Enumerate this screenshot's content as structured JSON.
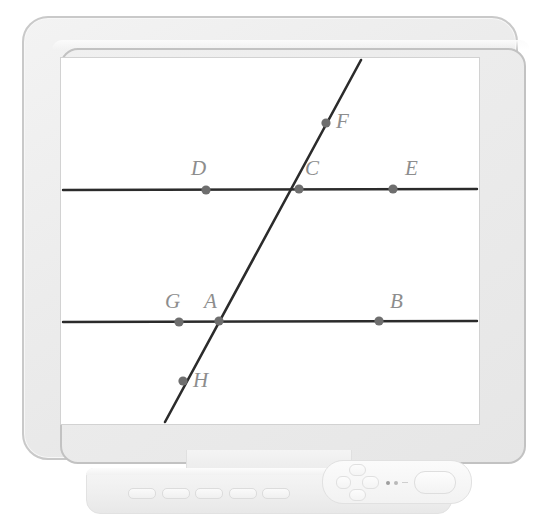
{
  "device": {
    "type": "lcd-monitor",
    "bezel_color": "#ececec",
    "screen_color": "#ffffff"
  },
  "controls": {
    "menu_buttons": [
      {
        "name": "menu-button-1",
        "label": ""
      },
      {
        "name": "menu-button-2",
        "label": ""
      },
      {
        "name": "menu-button-3",
        "label": ""
      },
      {
        "name": "menu-button-4",
        "label": ""
      },
      {
        "name": "menu-button-5",
        "label": ""
      }
    ],
    "dpad": {
      "up": "",
      "down": "",
      "left": "",
      "right": ""
    },
    "indicators": [
      {
        "name": "led-indicator-1",
        "color": "#9e9e9e"
      },
      {
        "name": "led-indicator-2",
        "color": "#b9b9b9"
      }
    ],
    "power_button_label": ""
  },
  "chart_data": {
    "type": "diagram",
    "title": "",
    "subtitle": "",
    "xlabel": "",
    "ylabel": "",
    "line_color": "#2b2b2b",
    "point_color": "#6e6e6e",
    "label_color": "#8d8d8d",
    "viewbox": {
      "width": 418,
      "height": 366
    },
    "lines": [
      {
        "name": "upper-parallel-line",
        "x1": 2,
        "y1": 132,
        "x2": 416,
        "y2": 131,
        "stroke_width": 2.4
      },
      {
        "name": "lower-parallel-line",
        "x1": 2,
        "y1": 264,
        "x2": 416,
        "y2": 263,
        "stroke_width": 2.4
      },
      {
        "name": "transversal-line",
        "x1": 300,
        "y1": 2,
        "x2": 104,
        "y2": 364,
        "stroke_width": 2.6
      }
    ],
    "points": [
      {
        "id": "D",
        "label": "D",
        "cx": 145,
        "cy": 132,
        "r": 4.6,
        "label_x": 130,
        "label_y": 100
      },
      {
        "id": "C",
        "label": "C",
        "cx": 238,
        "cy": 131,
        "r": 4.6,
        "label_x": 244,
        "label_y": 100
      },
      {
        "id": "E",
        "label": "E",
        "cx": 332,
        "cy": 131,
        "r": 4.6,
        "label_x": 344,
        "label_y": 100
      },
      {
        "id": "F",
        "label": "F",
        "cx": 265,
        "cy": 65,
        "r": 4.6,
        "label_x": 275,
        "label_y": 53
      },
      {
        "id": "G",
        "label": "G",
        "cx": 118,
        "cy": 264,
        "r": 4.6,
        "label_x": 104,
        "label_y": 233
      },
      {
        "id": "A",
        "label": "A",
        "cx": 158,
        "cy": 263,
        "r": 4.6,
        "label_x": 143,
        "label_y": 233
      },
      {
        "id": "B",
        "label": "B",
        "cx": 318,
        "cy": 263,
        "r": 4.6,
        "label_x": 329,
        "label_y": 233
      },
      {
        "id": "H",
        "label": "H",
        "cx": 122,
        "cy": 323,
        "r": 4.6,
        "label_x": 132,
        "label_y": 312
      }
    ],
    "legend": [],
    "grid": false
  }
}
